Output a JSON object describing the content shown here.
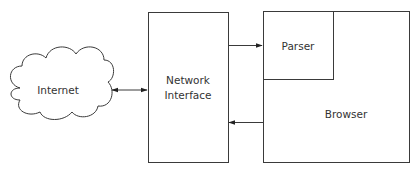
{
  "nodes": {
    "internet": {
      "label": "Internet"
    },
    "network_interface": {
      "line1": "Network",
      "line2": "Interface"
    },
    "parser": {
      "label": "Parser"
    },
    "browser": {
      "label": "Browser"
    }
  },
  "edges": [
    {
      "from": "internet",
      "to": "network_interface",
      "type": "bidirectional"
    },
    {
      "from": "network_interface",
      "to": "parser",
      "type": "directed"
    },
    {
      "from": "browser",
      "to": "network_interface",
      "type": "directed"
    }
  ],
  "colors": {
    "stroke": "#3a3a3a",
    "text": "#333333",
    "background": "#ffffff"
  }
}
